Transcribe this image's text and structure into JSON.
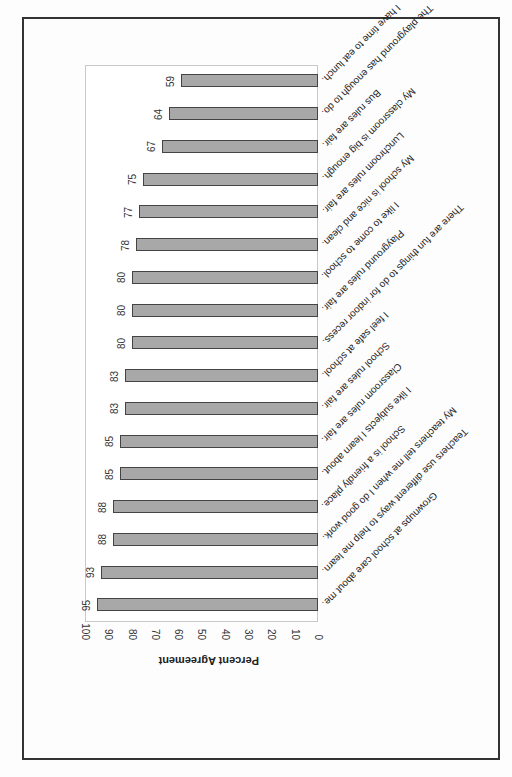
{
  "chart_data": {
    "type": "bar",
    "orientation": "horizontal",
    "rotation_in_image": 180,
    "title": "",
    "xlabel": "",
    "ylabel": "Percent Agreement",
    "ylim": [
      0,
      100
    ],
    "ticks": [
      "0",
      "10",
      "20",
      "30",
      "40",
      "50",
      "60",
      "70",
      "80",
      "90",
      "100"
    ],
    "categories": [
      "Grownups at school care about me.",
      "Teachers use different ways to help me learn.",
      "My teachers tell me when I do good work.",
      "School is a friendly place.",
      "I like subjects I learn about.",
      "Classroom rules are fair.",
      "School rules are fair.",
      "I feel safe at school.",
      "There are fun things to do for indoor recess.",
      "Playground rules are fair.",
      "I like to come to school.",
      "My school is nice and clean.",
      "Lunchroom rules are fair.",
      "My classroom is big enough.",
      "Bus rules are fair.",
      "The playground has enough to do.",
      "I have time to eat lunch."
    ],
    "values": [
      95,
      93,
      88,
      88,
      85,
      85,
      83,
      83,
      80,
      80,
      80,
      78,
      77,
      75,
      67,
      64,
      59
    ],
    "value_labels": [
      "95",
      "93",
      "88",
      "88",
      "85",
      "85",
      "83",
      "83",
      "80",
      "80",
      "80",
      "78",
      "77",
      "75",
      "67",
      "64",
      "59"
    ],
    "grid": false,
    "bar_color": "#a8a8a8",
    "bar_border_color": "#444444"
  }
}
